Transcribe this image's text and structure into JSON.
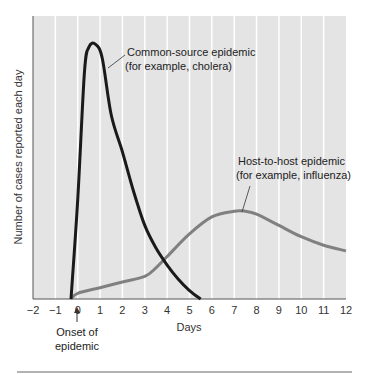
{
  "chart_data": {
    "type": "line",
    "title": "",
    "xlabel": "Days",
    "ylabel": "Number of cases reported each day",
    "xlim": [
      -2,
      12
    ],
    "ylim": [
      0,
      100
    ],
    "x_ticks": [
      -2,
      -1,
      0,
      1,
      2,
      3,
      4,
      5,
      6,
      7,
      8,
      9,
      10,
      11,
      12
    ],
    "x_tick_labels": [
      "−2",
      "−1",
      "0",
      "1",
      "2",
      "3",
      "4",
      "5",
      "6",
      "7",
      "8",
      "9",
      "10",
      "11",
      "12"
    ],
    "grid": {
      "vertical": true,
      "horizontal": false
    },
    "colors": {
      "plot_bg": "#e4e4e4",
      "grid": "#ffffff",
      "axis": "#555555"
    },
    "series": [
      {
        "name": "Common-source epidemic (for example, cholera)",
        "color": "#1a1a1a",
        "x": [
          -0.3,
          0.0,
          0.3,
          0.5,
          0.8,
          1.1,
          1.5,
          2.0,
          2.5,
          3.0,
          3.5,
          4.0,
          4.5,
          5.0,
          5.5
        ],
        "y": [
          0,
          35,
          80,
          89,
          90,
          85,
          65,
          52,
          38,
          26,
          18,
          12,
          7,
          3,
          0
        ]
      },
      {
        "name": "Host-to-host epidemic (for example, influenza)",
        "color": "#808080",
        "x": [
          -0.3,
          0,
          1,
          2,
          3,
          3.5,
          4,
          5,
          6,
          7,
          7.5,
          8,
          9,
          10,
          11,
          12
        ],
        "y": [
          0,
          2,
          4,
          6,
          8,
          11,
          15,
          23,
          29,
          31,
          31,
          30,
          26,
          22,
          19,
          17
        ]
      }
    ],
    "annotations": [
      {
        "lines": [
          "Common-source epidemic",
          "(for example, cholera)"
        ],
        "points_to": "peak of common-source curve"
      },
      {
        "lines": [
          "Host-to-host epidemic",
          "(for example, influenza)"
        ],
        "points_to": "peak of host-to-host curve"
      },
      {
        "lines": [
          "Onset of",
          "epidemic"
        ],
        "points_to": "x = 0",
        "arrow": "up"
      }
    ]
  },
  "labels": {
    "ylabel": "Number of cases reported each day",
    "xlabel": "Days",
    "common_line1": "Common-source epidemic",
    "common_line2": "(for example, cholera)",
    "host_line1": "Host-to-host epidemic",
    "host_line2": "(for example, influenza)",
    "onset_line1": "Onset of",
    "onset_line2": "epidemic"
  }
}
